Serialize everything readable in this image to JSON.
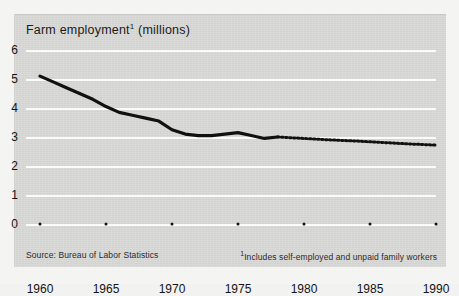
{
  "chart_data": {
    "type": "line",
    "title": "Farm employment",
    "title_superscript": "1",
    "title_unit": "(millions)",
    "xlabel": "",
    "ylabel": "",
    "ylim": [
      0,
      6
    ],
    "xlim": [
      1960,
      1990
    ],
    "ytick_labels": [
      "0",
      "1",
      "2",
      "3",
      "4",
      "5",
      "6"
    ],
    "ytick_values": [
      0,
      1,
      2,
      3,
      4,
      5,
      6
    ],
    "xtick_labels": [
      "1960",
      "1965",
      "1970",
      "1975",
      "1980",
      "1985",
      "1990"
    ],
    "xtick_values": [
      1960,
      1965,
      1970,
      1975,
      1980,
      1985,
      1990
    ],
    "grid": "horizontal",
    "legend": "none",
    "series": [
      {
        "name": "Farm employment (actual)",
        "style": "solid",
        "color": "#111111",
        "x": [
          1960,
          1961,
          1962,
          1963,
          1964,
          1965,
          1966,
          1967,
          1968,
          1969,
          1970,
          1971,
          1972,
          1973,
          1974,
          1975,
          1976,
          1977,
          1978
        ],
        "values": [
          5.1,
          4.9,
          4.7,
          4.5,
          4.3,
          4.05,
          3.85,
          3.75,
          3.65,
          3.55,
          3.25,
          3.1,
          3.05,
          3.05,
          3.1,
          3.15,
          3.05,
          2.95,
          3.0
        ]
      },
      {
        "name": "Farm employment (projected)",
        "style": "dotted",
        "color": "#111111",
        "x": [
          1978,
          1980,
          1982,
          1984,
          1986,
          1988,
          1990
        ],
        "values": [
          3.0,
          2.95,
          2.9,
          2.86,
          2.81,
          2.76,
          2.72
        ]
      }
    ]
  },
  "footer": {
    "source": "Source: Bureau of Labor Statistics",
    "footnote_marker": "1",
    "footnote": "Includes self-employed and unpaid family workers"
  },
  "colors": {
    "paper": "#d9d9d7",
    "ink": "#111111",
    "gridline": "#fbfbfa"
  }
}
